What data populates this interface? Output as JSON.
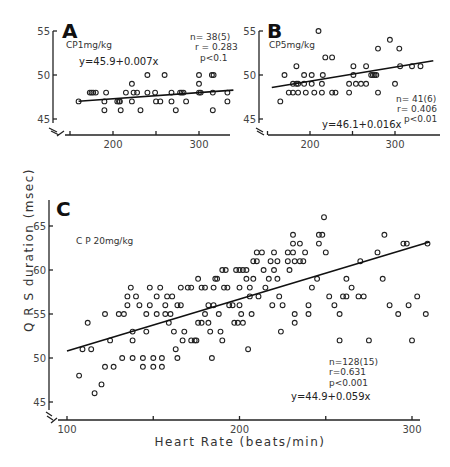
{
  "figure": {
    "ylabel": "Q R S duration (msec)",
    "xlabel": "Heart Rate (beats/min)"
  },
  "panels": {
    "A": {
      "letter": "A",
      "dose": "CP1mg/kg",
      "n": "n= 38(5)",
      "r": "r = 0.283",
      "p": "p<0.1",
      "eq": "y=45.9+0.007x"
    },
    "B": {
      "letter": "B",
      "dose": "CP5mg/kg",
      "n": "n= 41(6)",
      "r": "r= 0.406",
      "p": "p<0.01",
      "eq": "y=46.1+0.016x"
    },
    "C": {
      "letter": "C",
      "dose": "C P 20mg/kg",
      "n": "n=128(15)",
      "r": "r=0.631",
      "p": "p<0.001",
      "eq": "y=44.9+0.059x"
    }
  },
  "chart_data": [
    {
      "type": "scatter",
      "title": "A",
      "subtitle": "CP1mg/kg",
      "xlabel": "Heart Rate (beats/min)",
      "ylabel": "QRS duration (msec)",
      "xlim": [
        145,
        340
      ],
      "ylim": [
        44,
        55
      ],
      "xticks": [
        200,
        300
      ],
      "yticks": [
        45,
        50,
        55
      ],
      "regression": {
        "intercept": 45.9,
        "slope": 0.007,
        "x_range": [
          160,
          340
        ]
      },
      "stats": {
        "n": 38,
        "animals": 5,
        "r": 0.283,
        "p": "<0.1"
      },
      "points": [
        [
          160,
          47
        ],
        [
          173,
          48
        ],
        [
          175,
          48
        ],
        [
          177,
          48
        ],
        [
          180,
          48
        ],
        [
          190,
          47
        ],
        [
          190,
          46
        ],
        [
          192,
          48
        ],
        [
          205,
          47
        ],
        [
          207,
          47
        ],
        [
          208,
          47
        ],
        [
          209,
          46
        ],
        [
          215,
          48
        ],
        [
          222,
          49
        ],
        [
          222,
          47
        ],
        [
          224,
          48
        ],
        [
          228,
          48
        ],
        [
          232,
          46
        ],
        [
          240,
          50
        ],
        [
          240,
          48
        ],
        [
          249,
          48
        ],
        [
          250,
          47
        ],
        [
          255,
          47
        ],
        [
          260,
          50
        ],
        [
          268,
          48
        ],
        [
          268,
          47
        ],
        [
          273,
          46
        ],
        [
          278,
          48
        ],
        [
          280,
          48
        ],
        [
          282,
          48
        ],
        [
          285,
          47
        ],
        [
          300,
          50
        ],
        [
          300,
          49
        ],
        [
          300,
          48
        ],
        [
          302,
          48
        ],
        [
          315,
          50
        ],
        [
          317,
          50
        ],
        [
          316,
          46
        ],
        [
          316,
          48
        ],
        [
          333,
          48
        ],
        [
          333,
          47
        ]
      ]
    },
    {
      "type": "scatter",
      "title": "B",
      "subtitle": "CP5mg/kg",
      "xlabel": "Heart Rate (beats/min)",
      "ylabel": "QRS duration (msec)",
      "xlim": [
        145,
        345
      ],
      "ylim": [
        44,
        55
      ],
      "xticks": [
        200,
        300
      ],
      "yticks": [
        45,
        50,
        55
      ],
      "regression": {
        "intercept": 46.1,
        "slope": 0.016,
        "x_range": [
          155,
          345
        ]
      },
      "stats": {
        "n": 41,
        "animals": 6,
        "r": 0.406,
        "p": "<0.01"
      },
      "points": [
        [
          165,
          47
        ],
        [
          170,
          50
        ],
        [
          175,
          48
        ],
        [
          180,
          48
        ],
        [
          180,
          49
        ],
        [
          184,
          49
        ],
        [
          184,
          51
        ],
        [
          186,
          48
        ],
        [
          186,
          49
        ],
        [
          193,
          50
        ],
        [
          193,
          49
        ],
        [
          195,
          48
        ],
        [
          202,
          50
        ],
        [
          202,
          49
        ],
        [
          205,
          48
        ],
        [
          210,
          55
        ],
        [
          214,
          48
        ],
        [
          214,
          49
        ],
        [
          215,
          50
        ],
        [
          218,
          52
        ],
        [
          226,
          52
        ],
        [
          226,
          48
        ],
        [
          230,
          48
        ],
        [
          246,
          49
        ],
        [
          246,
          48
        ],
        [
          251,
          51
        ],
        [
          251,
          50
        ],
        [
          254,
          49
        ],
        [
          260,
          49
        ],
        [
          266,
          51
        ],
        [
          266,
          49
        ],
        [
          272,
          50
        ],
        [
          274,
          50
        ],
        [
          276,
          50
        ],
        [
          278,
          50
        ],
        [
          280,
          53
        ],
        [
          280,
          48
        ],
        [
          294,
          54
        ],
        [
          300,
          49
        ],
        [
          305,
          53
        ],
        [
          306,
          51
        ],
        [
          320,
          51
        ],
        [
          330,
          51
        ]
      ]
    },
    {
      "type": "scatter",
      "title": "C",
      "subtitle": "C P 20mg/kg",
      "xlabel": "Heart Rate (beats/min)",
      "ylabel": "QRS duration (msec)",
      "xlim": [
        90,
        310
      ],
      "ylim": [
        44,
        67
      ],
      "xticks": [
        100,
        200,
        300
      ],
      "yticks": [
        45,
        50,
        55,
        60,
        65
      ],
      "regression": {
        "intercept": 44.9,
        "slope": 0.059,
        "x_range": [
          100,
          310
        ]
      },
      "stats": {
        "n": 128,
        "animals": 15,
        "r": 0.631,
        "p": "<0.001"
      },
      "points": [
        [
          107,
          48
        ],
        [
          109,
          51
        ],
        [
          112,
          54
        ],
        [
          114,
          51
        ],
        [
          116,
          46
        ],
        [
          120,
          47
        ],
        [
          122,
          49
        ],
        [
          122,
          55
        ],
        [
          125,
          52
        ],
        [
          127,
          49
        ],
        [
          130,
          55
        ],
        [
          132,
          50
        ],
        [
          133,
          55
        ],
        [
          135,
          56
        ],
        [
          135,
          57
        ],
        [
          137,
          58
        ],
        [
          138,
          53
        ],
        [
          138,
          52
        ],
        [
          138,
          50
        ],
        [
          140,
          57
        ],
        [
          142,
          56
        ],
        [
          144,
          50
        ],
        [
          144,
          49
        ],
        [
          146,
          55
        ],
        [
          146,
          53
        ],
        [
          148,
          58
        ],
        [
          148,
          56
        ],
        [
          150,
          50
        ],
        [
          150,
          49
        ],
        [
          152,
          57
        ],
        [
          152,
          55
        ],
        [
          154,
          58
        ],
        [
          155,
          50
        ],
        [
          155,
          49
        ],
        [
          157,
          56
        ],
        [
          157,
          55
        ],
        [
          158,
          57
        ],
        [
          159,
          54
        ],
        [
          160,
          55
        ],
        [
          161,
          57
        ],
        [
          162,
          53
        ],
        [
          163,
          51
        ],
        [
          164,
          50
        ],
        [
          164,
          56
        ],
        [
          166,
          56
        ],
        [
          166,
          58
        ],
        [
          167,
          52
        ],
        [
          168,
          53
        ],
        [
          170,
          58
        ],
        [
          172,
          58
        ],
        [
          172,
          52
        ],
        [
          174,
          52
        ],
        [
          175,
          52
        ],
        [
          176,
          59
        ],
        [
          176,
          54
        ],
        [
          178,
          58
        ],
        [
          178,
          54
        ],
        [
          180,
          58
        ],
        [
          180,
          55
        ],
        [
          182,
          56
        ],
        [
          182,
          54
        ],
        [
          183,
          53
        ],
        [
          184,
          50
        ],
        [
          185,
          58
        ],
        [
          185,
          56
        ],
        [
          186,
          59
        ],
        [
          187,
          59
        ],
        [
          188,
          55
        ],
        [
          189,
          53
        ],
        [
          190,
          60
        ],
        [
          190,
          52
        ],
        [
          191,
          58
        ],
        [
          192,
          60
        ],
        [
          193,
          58
        ],
        [
          194,
          56
        ],
        [
          196,
          56
        ],
        [
          197,
          54
        ],
        [
          198,
          60
        ],
        [
          199,
          54
        ],
        [
          200,
          56
        ],
        [
          200,
          58
        ],
        [
          200,
          60
        ],
        [
          201,
          55
        ],
        [
          202,
          54
        ],
        [
          202,
          60
        ],
        [
          204,
          60
        ],
        [
          204,
          59
        ],
        [
          205,
          51
        ],
        [
          206,
          58
        ],
        [
          206,
          57
        ],
        [
          207,
          55
        ],
        [
          208,
          61
        ],
        [
          208,
          59
        ],
        [
          210,
          62
        ],
        [
          210,
          61
        ],
        [
          211,
          57
        ],
        [
          213,
          62
        ],
        [
          214,
          60
        ],
        [
          215,
          58
        ],
        [
          217,
          59
        ],
        [
          218,
          61
        ],
        [
          219,
          56
        ],
        [
          220,
          60
        ],
        [
          220,
          62
        ],
        [
          222,
          61
        ],
        [
          222,
          59
        ],
        [
          223,
          57
        ],
        [
          224,
          53
        ],
        [
          225,
          56
        ],
        [
          228,
          62
        ],
        [
          228,
          61
        ],
        [
          229,
          60
        ],
        [
          231,
          64
        ],
        [
          231,
          63
        ],
        [
          231,
          62
        ],
        [
          232,
          61
        ],
        [
          232,
          55
        ],
        [
          232,
          54
        ],
        [
          235,
          63
        ],
        [
          235,
          61
        ],
        [
          237,
          61
        ],
        [
          238,
          62
        ],
        [
          240,
          56
        ],
        [
          240,
          55
        ],
        [
          242,
          58
        ],
        [
          245,
          59
        ],
        [
          246,
          63
        ],
        [
          246,
          64
        ],
        [
          248,
          64
        ],
        [
          249,
          66
        ],
        [
          250,
          62
        ],
        [
          252,
          57
        ],
        [
          255,
          56
        ],
        [
          258,
          55
        ],
        [
          258,
          52
        ],
        [
          260,
          57
        ],
        [
          262,
          57
        ],
        [
          262,
          59
        ],
        [
          265,
          58
        ],
        [
          269,
          57
        ],
        [
          270,
          61
        ],
        [
          272,
          57
        ],
        [
          275,
          52
        ],
        [
          280,
          62
        ],
        [
          283,
          59
        ],
        [
          284,
          64
        ],
        [
          287,
          56
        ],
        [
          292,
          55
        ],
        [
          295,
          63
        ],
        [
          297,
          63
        ],
        [
          298,
          56
        ],
        [
          300,
          52
        ],
        [
          303,
          57
        ],
        [
          308,
          55
        ],
        [
          309,
          63
        ]
      ]
    }
  ]
}
